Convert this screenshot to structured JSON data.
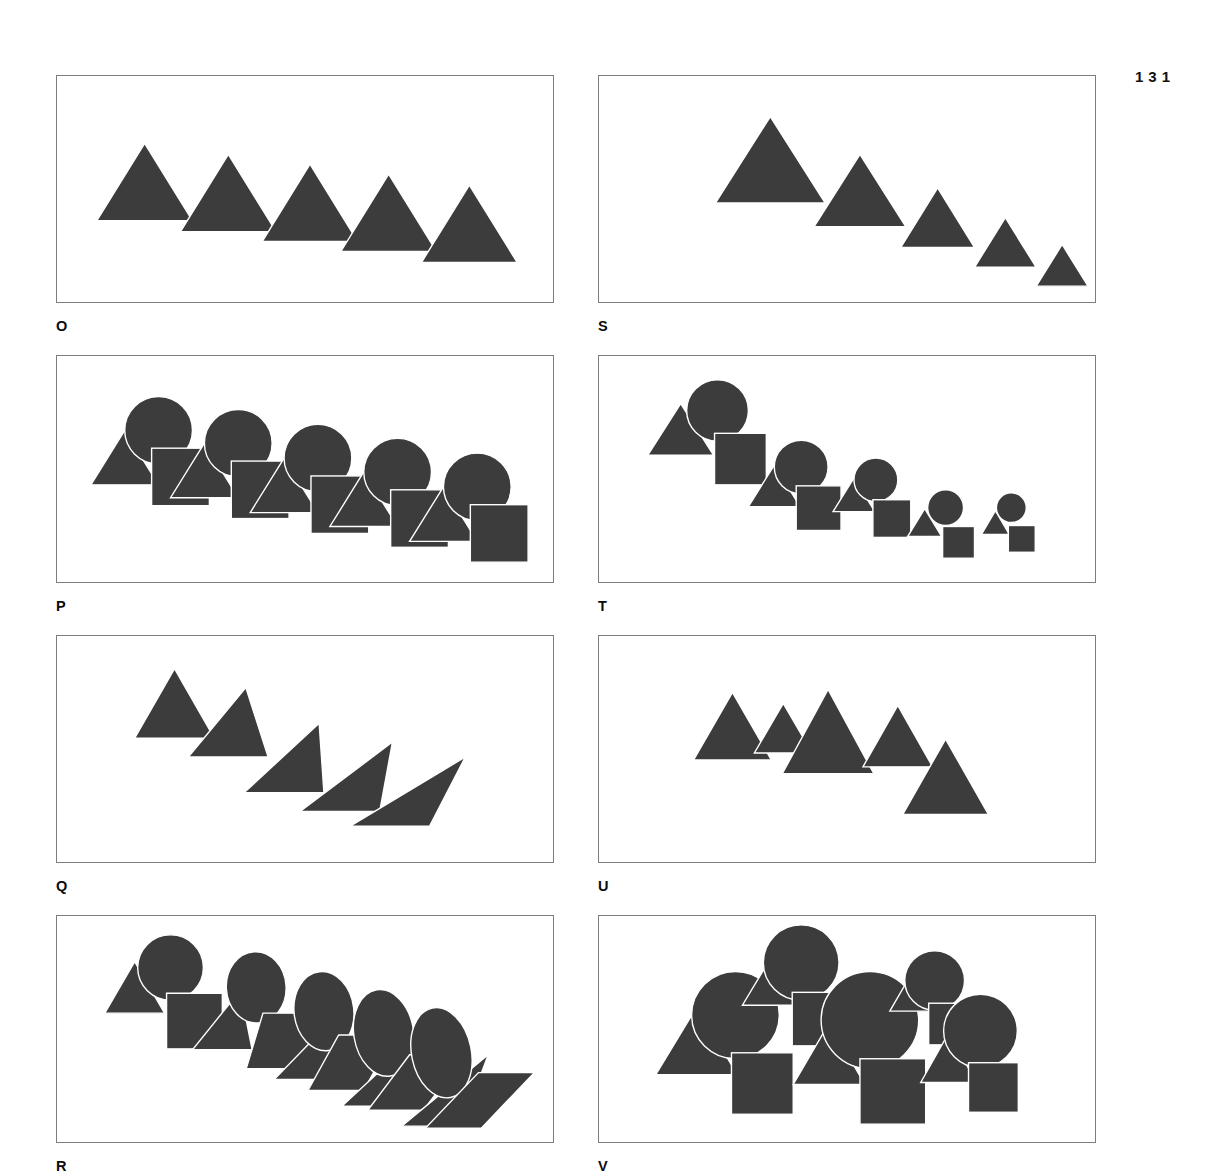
{
  "page": {
    "number": "131",
    "background_color": "#ffffff",
    "shape_fill_color": "#3c3c3c",
    "frame_border_color": "#7d7d7d",
    "outline_color": "#ffffff"
  },
  "layout": {
    "columns": 2,
    "rows": 4,
    "panel_width": 498,
    "panel_height": 228,
    "column_gap": 44,
    "row_gap": 52,
    "origin_x": 56,
    "origin_y": 75
  },
  "panels": [
    {
      "label": "O",
      "column": 0,
      "row": 0,
      "description": "five equal triangles stepping down",
      "shape_set": "triangle",
      "variation": "position-only",
      "count": 5
    },
    {
      "label": "S",
      "column": 1,
      "row": 0,
      "description": "five triangles decreasing in size stepping down",
      "shape_set": "triangle",
      "variation": "size-graded",
      "count": 5
    },
    {
      "label": "P",
      "column": 0,
      "row": 1,
      "description": "five groups of triangle, circle and square, equal size, stepping down",
      "shape_set": "triangle-circle-square",
      "variation": "position-only",
      "count": 5
    },
    {
      "label": "T",
      "column": 1,
      "row": 1,
      "description": "five groups of triangle, circle and square decreasing in size stepping down",
      "shape_set": "triangle-circle-square",
      "variation": "size-graded",
      "count": 5
    },
    {
      "label": "Q",
      "column": 0,
      "row": 2,
      "description": "five triangles progressively sheared stepping down",
      "shape_set": "triangle",
      "variation": "shear-graded",
      "count": 5
    },
    {
      "label": "U",
      "column": 1,
      "row": 2,
      "description": "five triangles at irregular sizes and positions",
      "shape_set": "triangle",
      "variation": "random",
      "count": 5
    },
    {
      "label": "R",
      "column": 0,
      "row": 3,
      "description": "five groups of triangle, circle and square progressively sheared into ellipses and parallelograms",
      "shape_set": "triangle-circle-square",
      "variation": "shear-graded",
      "count": 5
    },
    {
      "label": "V",
      "column": 1,
      "row": 3,
      "description": "five groups of triangle, circle and square at irregular sizes and positions",
      "shape_set": "triangle-circle-square",
      "variation": "random",
      "count": 5
    }
  ],
  "shape_data": {
    "O": [
      {
        "type": "triangle",
        "cx": 88,
        "by": 146,
        "w": 96,
        "h": 78
      },
      {
        "type": "triangle",
        "cx": 172,
        "by": 157,
        "w": 96,
        "h": 78
      },
      {
        "type": "triangle",
        "cx": 254,
        "by": 167,
        "w": 96,
        "h": 78
      },
      {
        "type": "triangle",
        "cx": 333,
        "by": 177,
        "w": 96,
        "h": 78
      },
      {
        "type": "triangle",
        "cx": 414,
        "by": 188,
        "w": 96,
        "h": 78
      }
    ],
    "S": [
      {
        "type": "triangle",
        "cx": 172,
        "by": 128,
        "w": 110,
        "h": 87
      },
      {
        "type": "triangle",
        "cx": 262,
        "by": 152,
        "w": 92,
        "h": 73
      },
      {
        "type": "triangle",
        "cx": 340,
        "by": 173,
        "w": 74,
        "h": 60
      },
      {
        "type": "triangle",
        "cx": 408,
        "by": 193,
        "w": 62,
        "h": 50
      },
      {
        "type": "triangle",
        "cx": 465,
        "by": 212,
        "w": 52,
        "h": 42
      }
    ],
    "P": [
      {
        "type": "triangle",
        "cx": 68,
        "by": 130,
        "w": 68,
        "h": 55
      },
      {
        "type": "circle",
        "cx": 102,
        "cy": 75,
        "r": 34
      },
      {
        "type": "square",
        "x": 95,
        "y": 93,
        "w": 58,
        "h": 58
      },
      {
        "type": "triangle",
        "cx": 148,
        "by": 143,
        "w": 68,
        "h": 55
      },
      {
        "type": "circle",
        "cx": 182,
        "cy": 88,
        "r": 34
      },
      {
        "type": "square",
        "x": 175,
        "y": 106,
        "w": 58,
        "h": 58
      },
      {
        "type": "triangle",
        "cx": 228,
        "by": 158,
        "w": 68,
        "h": 55
      },
      {
        "type": "circle",
        "cx": 262,
        "cy": 103,
        "r": 34
      },
      {
        "type": "square",
        "x": 255,
        "y": 121,
        "w": 58,
        "h": 58
      },
      {
        "type": "triangle",
        "cx": 308,
        "by": 172,
        "w": 68,
        "h": 55
      },
      {
        "type": "circle",
        "cx": 342,
        "cy": 117,
        "r": 34
      },
      {
        "type": "square",
        "x": 335,
        "y": 135,
        "w": 58,
        "h": 58
      },
      {
        "type": "triangle",
        "cx": 388,
        "by": 187,
        "w": 68,
        "h": 55
      },
      {
        "type": "circle",
        "cx": 422,
        "cy": 132,
        "r": 34
      },
      {
        "type": "square",
        "x": 415,
        "y": 150,
        "w": 58,
        "h": 58
      }
    ],
    "T": [
      {
        "type": "triangle",
        "cx": 82,
        "by": 100,
        "w": 66,
        "h": 52
      },
      {
        "type": "circle",
        "cx": 119,
        "cy": 55,
        "r": 31
      },
      {
        "type": "square",
        "x": 116,
        "y": 78,
        "w": 52,
        "h": 52
      },
      {
        "type": "triangle",
        "cx": 176,
        "by": 152,
        "w": 52,
        "h": 42
      },
      {
        "type": "circle",
        "cx": 203,
        "cy": 112,
        "r": 27
      },
      {
        "type": "square",
        "x": 198,
        "y": 131,
        "w": 45,
        "h": 45
      },
      {
        "type": "triangle",
        "cx": 256,
        "by": 157,
        "w": 42,
        "h": 34
      },
      {
        "type": "circle",
        "cx": 278,
        "cy": 125,
        "r": 22
      },
      {
        "type": "square",
        "x": 275,
        "y": 145,
        "w": 38,
        "h": 38
      },
      {
        "type": "triangle",
        "cx": 327,
        "by": 182,
        "w": 34,
        "h": 28
      },
      {
        "type": "circle",
        "cx": 348,
        "cy": 153,
        "r": 18
      },
      {
        "type": "square",
        "x": 345,
        "y": 172,
        "w": 32,
        "h": 32
      },
      {
        "type": "triangle",
        "cx": 398,
        "by": 180,
        "w": 28,
        "h": 24
      },
      {
        "type": "circle",
        "cx": 414,
        "cy": 153,
        "r": 15
      },
      {
        "type": "square",
        "x": 411,
        "y": 171,
        "w": 27,
        "h": 27
      }
    ],
    "Q": [
      {
        "type": "triangle_shear",
        "cx": 118,
        "by": 103,
        "w": 80,
        "h": 70,
        "shear": 0
      },
      {
        "type": "triangle_shear",
        "cx": 172,
        "by": 122,
        "w": 80,
        "h": 70,
        "shear": 0.22
      },
      {
        "type": "triangle_shear",
        "cx": 228,
        "by": 158,
        "w": 80,
        "h": 70,
        "shear": 0.44
      },
      {
        "type": "triangle_shear",
        "cx": 284,
        "by": 177,
        "w": 80,
        "h": 70,
        "shear": 0.66
      },
      {
        "type": "triangle_shear",
        "cx": 334,
        "by": 192,
        "w": 80,
        "h": 70,
        "shear": 0.95
      }
    ],
    "U": [
      {
        "type": "triangle",
        "cx": 134,
        "by": 125,
        "w": 78,
        "h": 68
      },
      {
        "type": "triangle",
        "cx": 185,
        "by": 118,
        "w": 58,
        "h": 50
      },
      {
        "type": "triangle",
        "cx": 230,
        "by": 139,
        "w": 92,
        "h": 85
      },
      {
        "type": "triangle",
        "cx": 300,
        "by": 132,
        "w": 70,
        "h": 62
      },
      {
        "type": "triangle",
        "cx": 348,
        "by": 180,
        "w": 86,
        "h": 76
      }
    ],
    "R": [
      {
        "type": "triangle_shear",
        "cx": 78,
        "by": 98,
        "w": 60,
        "h": 52,
        "shear": 0
      },
      {
        "type": "circle_shear",
        "cx": 114,
        "cy": 52,
        "rx": 33,
        "ry": 33,
        "shear": 0
      },
      {
        "type": "square_shear",
        "x": 110,
        "y": 78,
        "w": 56,
        "h": 56,
        "shear": 0
      },
      {
        "type": "triangle_shear",
        "cx": 166,
        "by": 135,
        "w": 60,
        "h": 60,
        "shear": 0.3
      },
      {
        "type": "circle_shear",
        "cx": 200,
        "cy": 72,
        "rx": 30,
        "ry": 36,
        "shear": 0.15
      },
      {
        "type": "square_shear",
        "x": 190,
        "y": 98,
        "w": 56,
        "h": 56,
        "shear": 0.3
      },
      {
        "type": "triangle_shear",
        "cx": 248,
        "by": 165,
        "w": 60,
        "h": 65,
        "shear": 0.55
      },
      {
        "type": "circle_shear",
        "cx": 268,
        "cy": 96,
        "rx": 30,
        "ry": 40,
        "shear": 0.3
      },
      {
        "type": "square_shear",
        "x": 252,
        "y": 120,
        "w": 56,
        "h": 56,
        "shear": 0.55
      },
      {
        "type": "triangle_shear",
        "cx": 316,
        "by": 192,
        "w": 60,
        "h": 70,
        "shear": 0.75
      },
      {
        "type": "circle_shear",
        "cx": 328,
        "cy": 118,
        "rx": 30,
        "ry": 44,
        "shear": 0.42
      },
      {
        "type": "square_shear",
        "x": 312,
        "y": 140,
        "w": 56,
        "h": 56,
        "shear": 0.75
      },
      {
        "type": "triangle_shear",
        "cx": 376,
        "by": 212,
        "w": 60,
        "h": 72,
        "shear": 0.95
      },
      {
        "type": "circle_shear",
        "cx": 386,
        "cy": 138,
        "rx": 30,
        "ry": 46,
        "shear": 0.52
      },
      {
        "type": "square_shear",
        "x": 370,
        "y": 158,
        "w": 56,
        "h": 56,
        "shear": 0.95
      }
    ],
    "V": [
      {
        "type": "triangle",
        "cx": 98,
        "by": 160,
        "w": 82,
        "h": 68
      },
      {
        "type": "circle",
        "cx": 137,
        "cy": 100,
        "r": 44
      },
      {
        "type": "square",
        "x": 133,
        "y": 138,
        "w": 62,
        "h": 62
      },
      {
        "type": "triangle",
        "cx": 175,
        "by": 90,
        "w": 62,
        "h": 52
      },
      {
        "type": "circle",
        "cx": 203,
        "cy": 47,
        "r": 38
      },
      {
        "type": "square",
        "x": 194,
        "y": 77,
        "w": 54,
        "h": 54
      },
      {
        "type": "triangle",
        "cx": 231,
        "by": 170,
        "w": 72,
        "h": 62
      },
      {
        "type": "circle",
        "cx": 272,
        "cy": 105,
        "r": 49
      },
      {
        "type": "square",
        "x": 262,
        "y": 144,
        "w": 66,
        "h": 66
      },
      {
        "type": "triangle",
        "cx": 315,
        "by": 96,
        "w": 46,
        "h": 40
      },
      {
        "type": "circle",
        "cx": 337,
        "cy": 65,
        "r": 30
      },
      {
        "type": "square",
        "x": 331,
        "y": 88,
        "w": 42,
        "h": 42
      },
      {
        "type": "triangle",
        "cx": 351,
        "by": 168,
        "w": 56,
        "h": 50
      },
      {
        "type": "circle",
        "cx": 383,
        "cy": 116,
        "r": 37
      },
      {
        "type": "square",
        "x": 371,
        "y": 148,
        "w": 50,
        "h": 50
      }
    ]
  }
}
